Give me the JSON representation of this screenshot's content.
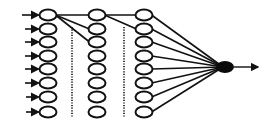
{
  "diagram": {
    "type": "neural-network",
    "colors": {
      "background": "#ffffff",
      "stroke": "#111111",
      "output_fill": "#0a0a0a"
    },
    "columns": [
      {
        "id": "col1",
        "x": 48,
        "nodes": 8
      },
      {
        "id": "col2",
        "x": 97,
        "nodes": 8
      },
      {
        "id": "col3",
        "x": 144,
        "nodes": 8
      }
    ],
    "row_y": [
      15,
      29,
      42,
      56,
      69,
      83,
      97,
      112
    ],
    "input_arrows": {
      "count": 8,
      "start_x": 22
    },
    "dotted_separators": [
      {
        "x": 72,
        "y1": 27,
        "y2": 118
      },
      {
        "x": 124,
        "y1": 27,
        "y2": 118
      }
    ],
    "output_node": {
      "x": 225,
      "y": 67,
      "rx": 9,
      "ry": 6
    },
    "output_arrow": {
      "end_x": 258
    }
  }
}
